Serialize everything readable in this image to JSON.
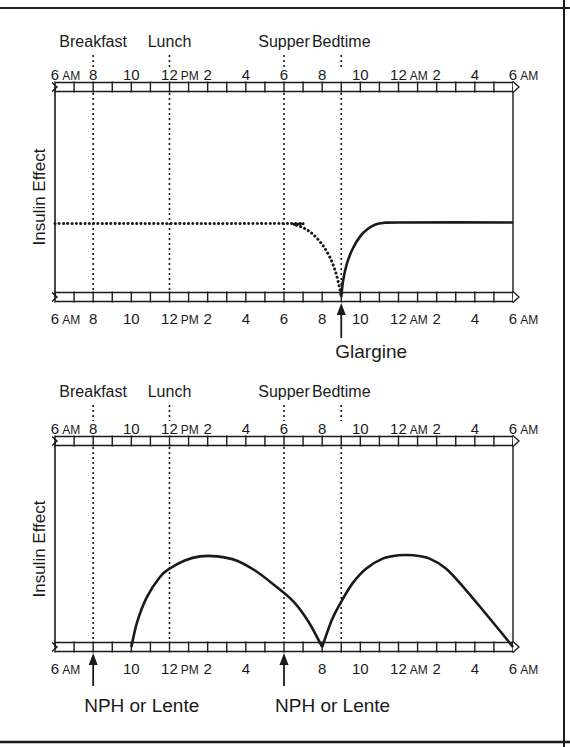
{
  "panels": [
    {
      "id": "glargine",
      "y_label": "Insulin Effect",
      "meals": [
        {
          "label": "Breakfast",
          "hour": 8
        },
        {
          "label": "Lunch",
          "hour": 12
        },
        {
          "label": "Supper",
          "hour": 18
        },
        {
          "label": "Bedtime",
          "hour": 21
        }
      ],
      "top_ticks": [
        {
          "hour": 6,
          "num": "6",
          "suffix": "AM"
        },
        {
          "hour": 8,
          "num": "8",
          "suffix": ""
        },
        {
          "hour": 10,
          "num": "10",
          "suffix": ""
        },
        {
          "hour": 12,
          "num": "12",
          "suffix": "PM"
        },
        {
          "hour": 14,
          "num": "2",
          "suffix": ""
        },
        {
          "hour": 16,
          "num": "4",
          "suffix": ""
        },
        {
          "hour": 18,
          "num": "6",
          "suffix": ""
        },
        {
          "hour": 20,
          "num": "8",
          "suffix": ""
        },
        {
          "hour": 22,
          "num": "10",
          "suffix": ""
        },
        {
          "hour": 24,
          "num": "12",
          "suffix": "AM"
        },
        {
          "hour": 26,
          "num": "2",
          "suffix": ""
        },
        {
          "hour": 28,
          "num": "4",
          "suffix": ""
        },
        {
          "hour": 30,
          "num": "6",
          "suffix": "AM"
        }
      ],
      "bottom_ticks": [
        {
          "hour": 6,
          "num": "6",
          "suffix": "AM"
        },
        {
          "hour": 8,
          "num": "8",
          "suffix": ""
        },
        {
          "hour": 10,
          "num": "10",
          "suffix": ""
        },
        {
          "hour": 12,
          "num": "12",
          "suffix": "PM"
        },
        {
          "hour": 14,
          "num": "2",
          "suffix": ""
        },
        {
          "hour": 16,
          "num": "4",
          "suffix": ""
        },
        {
          "hour": 18,
          "num": "6",
          "suffix": ""
        },
        {
          "hour": 20,
          "num": "8",
          "suffix": ""
        },
        {
          "hour": 22,
          "num": "10",
          "suffix": ""
        },
        {
          "hour": 24,
          "num": "12",
          "suffix": "AM"
        },
        {
          "hour": 26,
          "num": "2",
          "suffix": ""
        },
        {
          "hour": 28,
          "num": "4",
          "suffix": ""
        },
        {
          "hour": 30,
          "num": "6",
          "suffix": "AM"
        }
      ],
      "injections": [
        {
          "label": "Glargine",
          "hour": 21
        }
      ],
      "curves": [
        {
          "name": "previous-glargine",
          "style": "dotted",
          "points": [
            [
              6,
              0.35
            ],
            [
              18,
              0.35
            ],
            [
              18.5,
              0.345
            ],
            [
              19,
              0.33
            ],
            [
              19.5,
              0.3
            ],
            [
              20,
              0.25
            ],
            [
              20.4,
              0.19
            ],
            [
              20.7,
              0.12
            ],
            [
              20.9,
              0.05
            ],
            [
              21,
              0
            ]
          ]
        },
        {
          "name": "glargine",
          "style": "solid",
          "points": [
            [
              21,
              0
            ],
            [
              21.1,
              0.08
            ],
            [
              21.3,
              0.16
            ],
            [
              21.6,
              0.23
            ],
            [
              22,
              0.29
            ],
            [
              22.4,
              0.325
            ],
            [
              22.8,
              0.345
            ],
            [
              23.2,
              0.352
            ],
            [
              24,
              0.355
            ],
            [
              30,
              0.355
            ]
          ]
        }
      ]
    },
    {
      "id": "nph",
      "y_label": "Insulin Effect",
      "meals": [
        {
          "label": "Breakfast",
          "hour": 8
        },
        {
          "label": "Lunch",
          "hour": 12
        },
        {
          "label": "Supper",
          "hour": 18
        },
        {
          "label": "Bedtime",
          "hour": 21
        }
      ],
      "top_ticks": [
        {
          "hour": 6,
          "num": "6",
          "suffix": "AM"
        },
        {
          "hour": 8,
          "num": "8",
          "suffix": ""
        },
        {
          "hour": 10,
          "num": "10",
          "suffix": ""
        },
        {
          "hour": 12,
          "num": "12",
          "suffix": "PM"
        },
        {
          "hour": 14,
          "num": "2",
          "suffix": ""
        },
        {
          "hour": 16,
          "num": "4",
          "suffix": ""
        },
        {
          "hour": 18,
          "num": "6",
          "suffix": ""
        },
        {
          "hour": 20,
          "num": "8",
          "suffix": ""
        },
        {
          "hour": 22,
          "num": "10",
          "suffix": ""
        },
        {
          "hour": 24,
          "num": "12",
          "suffix": "AM"
        },
        {
          "hour": 26,
          "num": "2",
          "suffix": ""
        },
        {
          "hour": 28,
          "num": "4",
          "suffix": ""
        },
        {
          "hour": 30,
          "num": "6",
          "suffix": "AM"
        }
      ],
      "bottom_ticks": [
        {
          "hour": 6,
          "num": "6",
          "suffix": "AM"
        },
        {
          "hour": 10,
          "num": "10",
          "suffix": ""
        },
        {
          "hour": 12,
          "num": "12",
          "suffix": "PM"
        },
        {
          "hour": 14,
          "num": "2",
          "suffix": ""
        },
        {
          "hour": 16,
          "num": "4",
          "suffix": ""
        },
        {
          "hour": 20,
          "num": "8",
          "suffix": ""
        },
        {
          "hour": 22,
          "num": "10",
          "suffix": ""
        },
        {
          "hour": 24,
          "num": "12",
          "suffix": "AM"
        },
        {
          "hour": 26,
          "num": "2",
          "suffix": ""
        },
        {
          "hour": 28,
          "num": "4",
          "suffix": ""
        },
        {
          "hour": 30,
          "num": "6",
          "suffix": "AM"
        }
      ],
      "injections": [
        {
          "label": "NPH or Lente",
          "hour": 8
        },
        {
          "label": "NPH or Lente",
          "hour": 18
        }
      ],
      "curves": [
        {
          "name": "morning-nph",
          "style": "solid",
          "points": [
            [
              10,
              0
            ],
            [
              10.3,
              0.12
            ],
            [
              10.8,
              0.24
            ],
            [
              11.5,
              0.34
            ],
            [
              12,
              0.38
            ],
            [
              12.8,
              0.42
            ],
            [
              13.6,
              0.44
            ],
            [
              14.5,
              0.44
            ],
            [
              15.5,
              0.42
            ],
            [
              16.5,
              0.37
            ],
            [
              17.5,
              0.3
            ],
            [
              18.5,
              0.22
            ],
            [
              19.3,
              0.12
            ],
            [
              20,
              0
            ]
          ]
        },
        {
          "name": "evening-nph",
          "style": "solid",
          "points": [
            [
              20,
              0
            ],
            [
              20.5,
              0.13
            ],
            [
              21,
              0.22
            ],
            [
              21.6,
              0.31
            ],
            [
              22.3,
              0.38
            ],
            [
              23.2,
              0.43
            ],
            [
              24,
              0.445
            ],
            [
              24.8,
              0.445
            ],
            [
              25.6,
              0.43
            ],
            [
              26.5,
              0.38
            ],
            [
              27.5,
              0.28
            ],
            [
              28.5,
              0.17
            ],
            [
              29.3,
              0.08
            ],
            [
              30,
              0
            ]
          ]
        }
      ]
    }
  ],
  "chart_data": [
    {
      "type": "line",
      "title": "",
      "xlabel": "Time of day",
      "ylabel": "Insulin Effect",
      "xlim": [
        "6 AM",
        "6 AM (next day)"
      ],
      "annotations": [
        "Breakfast",
        "Lunch",
        "Supper",
        "Bedtime",
        "Glargine"
      ],
      "series": [
        {
          "name": "Prior glargine (dotted)",
          "x_hours": [
            6,
            18,
            19,
            20,
            21
          ],
          "values": [
            0.35,
            0.35,
            0.33,
            0.25,
            0
          ]
        },
        {
          "name": "Glargine (solid)",
          "x_hours": [
            21,
            22,
            23,
            30
          ],
          "values": [
            0,
            0.29,
            0.35,
            0.355
          ]
        }
      ]
    },
    {
      "type": "line",
      "title": "",
      "xlabel": "Time of day",
      "ylabel": "Insulin Effect",
      "xlim": [
        "6 AM",
        "6 AM (next day)"
      ],
      "annotations": [
        "Breakfast",
        "Lunch",
        "Supper",
        "Bedtime",
        "NPH or Lente",
        "NPH or Lente"
      ],
      "series": [
        {
          "name": "Morning NPH/Lente",
          "x_hours": [
            10,
            12,
            14,
            16,
            18,
            20
          ],
          "values": [
            0,
            0.38,
            0.44,
            0.4,
            0.26,
            0
          ]
        },
        {
          "name": "Evening NPH/Lente",
          "x_hours": [
            20,
            22,
            24,
            26,
            28,
            30
          ],
          "values": [
            0,
            0.35,
            0.445,
            0.41,
            0.23,
            0
          ]
        }
      ]
    }
  ]
}
